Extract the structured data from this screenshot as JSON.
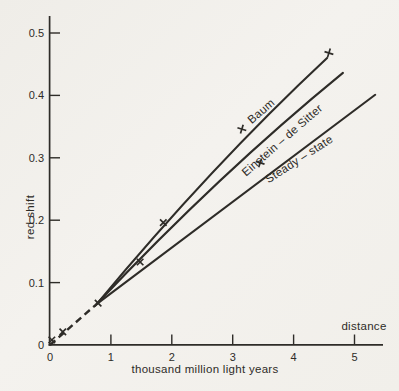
{
  "figure": {
    "background": "#f3f1ed",
    "ink": "#2e2c28"
  },
  "chart_data": {
    "type": "line",
    "title": "",
    "ylabel": "red shift",
    "xlabel": "thousand million light years",
    "xlabel_secondary": "distance",
    "xlim": [
      0,
      5.5
    ],
    "ylim": [
      0,
      0.52
    ],
    "x_ticks": [
      0,
      1,
      2,
      3,
      4,
      5
    ],
    "y_ticks": [
      0,
      0.1,
      0.2,
      0.3,
      0.4,
      0.5
    ],
    "grid": false,
    "legend_position": "labels-on-curves",
    "curves": [
      {
        "name": "Baum",
        "shape": "quadratic",
        "start": [
          0.77,
          0.066
        ],
        "control": [
          2.66,
          0.288
        ],
        "end": [
          4.55,
          0.46
        ]
      },
      {
        "name": "Einstein – de Sitter",
        "shape": "quadratic",
        "start": [
          0.77,
          0.066
        ],
        "control": [
          2.79,
          0.275
        ],
        "end": [
          4.81,
          0.436
        ]
      },
      {
        "name": "Steady – state",
        "shape": "line",
        "start": [
          0.77,
          0.066
        ],
        "end": [
          5.34,
          0.401
        ]
      }
    ],
    "shared_segment": {
      "from": [
        0,
        0
      ],
      "to": [
        0.77,
        0.066
      ],
      "style": "dashed"
    },
    "points": [
      {
        "x": 0.03,
        "y": 0.008,
        "marker": "cross"
      },
      {
        "x": 0.21,
        "y": 0.021,
        "marker": "cross"
      },
      {
        "x": 0.79,
        "y": 0.067,
        "marker": "cross"
      },
      {
        "x": 1.48,
        "y": 0.133,
        "marker": "cross"
      },
      {
        "x": 1.86,
        "y": 0.196,
        "marker": "cross"
      },
      {
        "x": 3.15,
        "y": 0.346,
        "marker": "plus"
      },
      {
        "x": 3.45,
        "y": 0.292,
        "marker": "plus"
      },
      {
        "x": 4.58,
        "y": 0.468,
        "marker": "plus"
      }
    ]
  }
}
